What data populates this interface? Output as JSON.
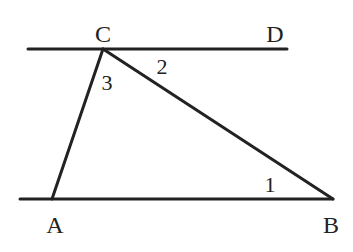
{
  "diagram": {
    "type": "geometry",
    "colors": {
      "stroke": "#222222",
      "background": "#ffffff"
    },
    "points": {
      "A": {
        "label": "A",
        "x": 52,
        "y": 199
      },
      "B": {
        "label": "B",
        "x": 333,
        "y": 199
      },
      "C": {
        "label": "C",
        "x": 103,
        "y": 49
      },
      "D": {
        "label": "D",
        "x": 273,
        "y": 49
      }
    },
    "lines": [
      {
        "name": "line-cd",
        "x1": 28,
        "y1": 49,
        "x2": 287,
        "y2": 49
      },
      {
        "name": "line-ab",
        "x1": 20,
        "y1": 199,
        "x2": 333,
        "y2": 199
      },
      {
        "name": "segment-ca",
        "x1": 103,
        "y1": 49,
        "x2": 52,
        "y2": 199
      },
      {
        "name": "segment-cb",
        "x1": 103,
        "y1": 49,
        "x2": 333,
        "y2": 199
      }
    ],
    "angles": [
      {
        "label": "1",
        "at": "B",
        "x": 270,
        "y": 192
      },
      {
        "label": "2",
        "at": "C",
        "x": 163,
        "y": 74
      },
      {
        "label": "3",
        "at": "C",
        "x": 108,
        "y": 90
      }
    ]
  }
}
